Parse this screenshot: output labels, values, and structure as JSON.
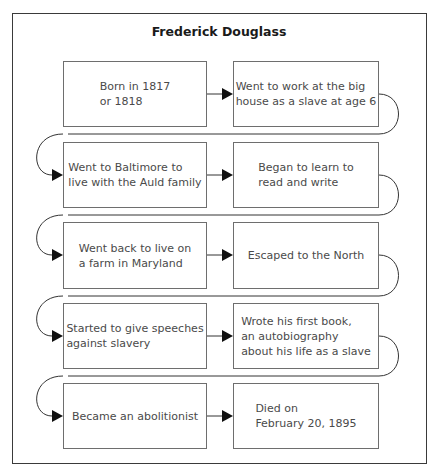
{
  "diagram": {
    "title": "Frederick Douglass",
    "type": "sequence-flowchart",
    "steps": [
      {
        "text": "Born in 1817\nor 1818"
      },
      {
        "text": "Went to work at the big\nhouse as a slave at age 6"
      },
      {
        "text": "Went to Baltimore to\nlive with the Auld family"
      },
      {
        "text": "Began to learn to\nread and write"
      },
      {
        "text": "Went back to live on\na farm in Maryland"
      },
      {
        "text": "Escaped to the North"
      },
      {
        "text": "Started to give speeches\nagainst slavery"
      },
      {
        "text": "Wrote his first book,\nan autobiography\nabout his life as a slave"
      },
      {
        "text": "Became an abolitionist"
      },
      {
        "text": "Died on\nFebruary 20, 1895"
      }
    ]
  },
  "colors": {
    "frame": "#3a3a3a",
    "box_border": "#6e6e6e",
    "text": "#4a4a4a",
    "arrow": "#111111"
  }
}
